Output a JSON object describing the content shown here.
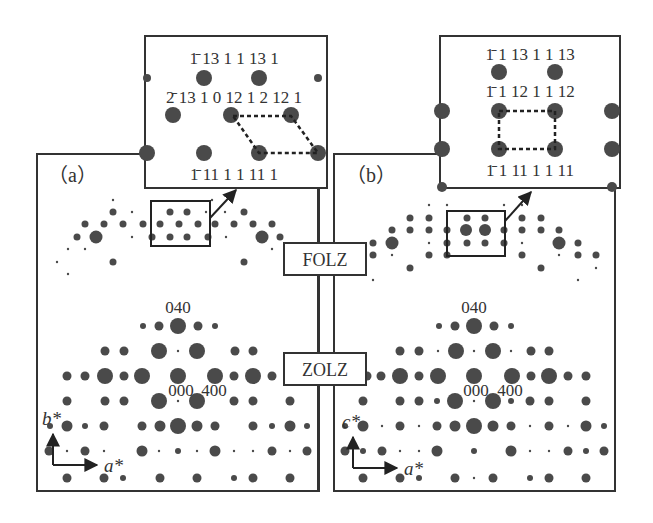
{
  "panels": [
    {
      "id": "a",
      "label": "（a）",
      "zolz_labels": {
        "top": "040",
        "center": "000",
        "right": "400"
      },
      "axes": {
        "vertical": "b*",
        "horizontal": "a*"
      },
      "inset": {
        "row1": "1̄ 13 1 1 13 1",
        "row2": "2̄ 13 1 0 12 1 2 12 1",
        "row3": "1̄ 11 1 1 11 1",
        "highlight_shape": "parallelogram"
      }
    },
    {
      "id": "b",
      "label": "（b）",
      "zolz_labels": {
        "top": "040",
        "center": "000",
        "right": "400"
      },
      "axes": {
        "vertical": "c*",
        "horizontal": "a*"
      },
      "inset": {
        "row1": "1̄ 1 13 1 1 13",
        "row2": "1̄ 1 12 1 1 12",
        "row3": "1̄ 1 11 1 1 11",
        "highlight_shape": "rectangle"
      }
    }
  ],
  "center_labels": {
    "folz": "FOLZ",
    "zolz": "ZOLZ"
  },
  "colors": {
    "spot": "#4a4a4a",
    "line": "#222222",
    "background": "#ffffff"
  }
}
